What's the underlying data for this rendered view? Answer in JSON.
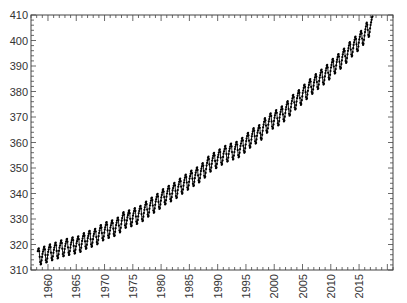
{
  "chart_data": {
    "type": "line",
    "title": "",
    "xlabel": "",
    "ylabel": "",
    "xlim": [
      1957,
      2021
    ],
    "ylim": [
      310,
      410
    ],
    "grid": false,
    "legend": null,
    "x_ticks": [
      1960,
      1965,
      1970,
      1975,
      1980,
      1985,
      1990,
      1995,
      2000,
      2005,
      2010,
      2015
    ],
    "y_ticks": [
      310,
      320,
      330,
      340,
      350,
      360,
      370,
      380,
      390,
      400,
      410
    ],
    "x_tick_labels": [
      "1960",
      "1965",
      "1970",
      "1975",
      "1980",
      "1985",
      "1990",
      "1995",
      "2000",
      "2005",
      "2010",
      "2015"
    ],
    "y_tick_labels": [
      "310",
      "320",
      "330",
      "340",
      "350",
      "360",
      "370",
      "380",
      "390",
      "400",
      "410"
    ],
    "x_tick_label_rotation": -90,
    "series": [
      {
        "name": "CO2 monthly (ppm)",
        "color": "#000000",
        "marker": "dot",
        "seasonal_amplitude_ppm": 6.5,
        "description": "Monthly mean series with annual seasonal oscillation around rising trend",
        "annual_mean": {
          "x": [
            1958,
            1959,
            1960,
            1961,
            1962,
            1963,
            1964,
            1965,
            1966,
            1967,
            1968,
            1969,
            1970,
            1971,
            1972,
            1973,
            1974,
            1975,
            1976,
            1977,
            1978,
            1979,
            1980,
            1981,
            1982,
            1983,
            1984,
            1985,
            1986,
            1987,
            1988,
            1989,
            1990,
            1991,
            1992,
            1993,
            1994,
            1995,
            1996,
            1997,
            1998,
            1999,
            2000,
            2001,
            2002,
            2003,
            2004,
            2005,
            2006,
            2007,
            2008,
            2009,
            2010,
            2011,
            2012,
            2013,
            2014,
            2015,
            2016,
            2017
          ],
          "values": [
            315.3,
            316.0,
            316.9,
            317.6,
            318.5,
            319.0,
            319.6,
            320.0,
            321.4,
            322.2,
            323.0,
            324.6,
            325.7,
            326.3,
            327.5,
            329.7,
            330.2,
            331.1,
            332.0,
            333.8,
            335.4,
            336.8,
            338.7,
            339.9,
            341.1,
            342.8,
            344.4,
            345.9,
            347.2,
            348.9,
            351.5,
            352.9,
            354.2,
            355.6,
            356.4,
            357.1,
            358.8,
            360.8,
            362.6,
            363.7,
            366.7,
            368.4,
            369.6,
            371.1,
            373.2,
            375.8,
            377.5,
            379.8,
            381.9,
            383.8,
            385.6,
            387.4,
            389.9,
            391.7,
            393.9,
            396.5,
            398.6,
            400.8,
            404.2,
            406.5
          ]
        }
      }
    ]
  }
}
